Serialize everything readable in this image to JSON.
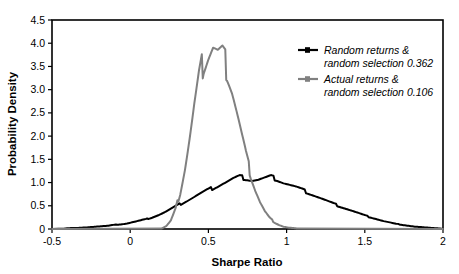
{
  "chart_data": {
    "type": "line",
    "title": "",
    "xlabel": "Sharpe Ratio",
    "ylabel": "Probability Density",
    "xlim": [
      -0.5,
      2
    ],
    "ylim": [
      0,
      4.5
    ],
    "xticks": [
      "-0.5",
      "0",
      "0.5",
      "1",
      "1.5",
      "2"
    ],
    "xtick_values": [
      -0.5,
      0,
      0.5,
      1,
      1.5,
      2
    ],
    "yticks": [
      "0",
      "0.5",
      "1.0",
      "1.5",
      "2.0",
      "2.5",
      "3.0",
      "3.5",
      "4.0",
      "4.5"
    ],
    "ytick_values": [
      0,
      0.5,
      1.0,
      1.5,
      2.0,
      2.5,
      3.0,
      3.5,
      4.0,
      4.5
    ],
    "grid": false,
    "legend_position": "top-right",
    "series": [
      {
        "name": "Random returns & random selection 0.362",
        "name_line1": "Random returns &",
        "name_line2": "random selection 0.362",
        "color": "#000000",
        "x": [
          -0.42,
          -0.38,
          -0.34,
          -0.3,
          -0.26,
          -0.22,
          -0.18,
          -0.14,
          -0.1,
          -0.06,
          -0.02,
          0.02,
          0.06,
          0.1,
          0.14,
          0.18,
          0.22,
          0.26,
          0.3,
          0.34,
          0.38,
          0.42,
          0.46,
          0.5,
          0.54,
          0.58,
          0.62,
          0.66,
          0.7,
          0.74,
          0.78,
          0.82,
          0.86,
          0.9,
          0.94,
          0.98,
          1.02,
          1.06,
          1.1,
          1.14,
          1.18,
          1.22,
          1.26,
          1.3,
          1.34,
          1.38,
          1.42,
          1.46,
          1.5,
          1.54,
          1.58,
          1.62,
          1.66,
          1.7,
          1.74,
          1.78,
          1.82,
          1.86,
          1.9,
          1.94,
          1.98
        ],
        "y": [
          0.01,
          0.02,
          0.02,
          0.03,
          0.04,
          0.05,
          0.06,
          0.07,
          0.09,
          0.1,
          0.12,
          0.15,
          0.18,
          0.21,
          0.25,
          0.3,
          0.36,
          0.43,
          0.5,
          0.57,
          0.64,
          0.71,
          0.78,
          0.84,
          0.9,
          0.96,
          1.02,
          1.08,
          1.12,
          1.09,
          1.05,
          1.06,
          1.09,
          1.12,
          1.07,
          1.0,
          0.95,
          0.9,
          0.84,
          0.78,
          0.72,
          0.66,
          0.6,
          0.54,
          0.49,
          0.44,
          0.39,
          0.34,
          0.29,
          0.25,
          0.21,
          0.17,
          0.14,
          0.11,
          0.09,
          0.07,
          0.05,
          0.04,
          0.03,
          0.02,
          0.01
        ]
      },
      {
        "name": "Actual returns & random selection 0.106",
        "name_line1": "Actual returns &",
        "name_line2": "random selection 0.106",
        "color": "#808080",
        "x": [
          0.2,
          0.23,
          0.26,
          0.29,
          0.32,
          0.35,
          0.38,
          0.41,
          0.44,
          0.47,
          0.5,
          0.53,
          0.56,
          0.59,
          0.62,
          0.65,
          0.68,
          0.71,
          0.74,
          0.77,
          0.8,
          0.83,
          0.86,
          0.89,
          0.92,
          0.95,
          0.98,
          1.01,
          1.04,
          1.07
        ],
        "y": [
          0.01,
          0.06,
          0.18,
          0.42,
          0.8,
          1.32,
          1.95,
          2.62,
          3.2,
          3.62,
          3.8,
          3.92,
          3.74,
          3.7,
          3.45,
          3.05,
          2.55,
          2.05,
          1.58,
          1.18,
          0.85,
          0.58,
          0.38,
          0.24,
          0.15,
          0.09,
          0.05,
          0.03,
          0.02,
          0.01
        ]
      }
    ]
  },
  "axes": {
    "x_title": "Sharpe Ratio",
    "y_title": "Probability Density"
  },
  "legend": {
    "items": [
      {
        "line1": "Random returns &",
        "line2": "random selection 0.362",
        "color": "#000000"
      },
      {
        "line1": "Actual returns &",
        "line2": "random selection 0.106",
        "color": "#808080"
      }
    ]
  },
  "colors": {
    "black_series": "#000000",
    "gray_series": "#808080",
    "frame": "#000000",
    "background": "#ffffff"
  }
}
